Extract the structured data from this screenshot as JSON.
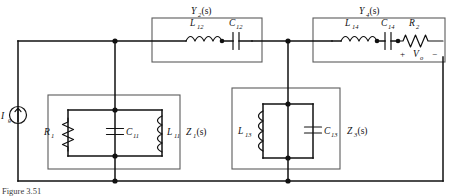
{
  "figure": {
    "caption": "Figure 3.51",
    "type": "ladder-network-circuit-diagram"
  },
  "source": {
    "label": "I",
    "subscript": "g",
    "name": "current-source",
    "direction": "up"
  },
  "output": {
    "plus": "+",
    "label": "V",
    "subscript": "o",
    "minus": "−"
  },
  "blocks": [
    {
      "id": "z1",
      "label": "Z",
      "subscript": "1",
      "arg": "(s)",
      "topology": "shunt",
      "components": [
        {
          "id": "r1",
          "label": "R",
          "subscript": "1",
          "kind": "resistor"
        },
        {
          "id": "c11",
          "label": "C",
          "subscript": "11",
          "kind": "capacitor"
        },
        {
          "id": "l11",
          "label": "L",
          "subscript": "11",
          "kind": "inductor"
        }
      ]
    },
    {
      "id": "y2",
      "label": "Y",
      "subscript": "2",
      "arg": "(s)",
      "topology": "series",
      "components": [
        {
          "id": "l12",
          "label": "L",
          "subscript": "12",
          "kind": "inductor"
        },
        {
          "id": "c12",
          "label": "C",
          "subscript": "12",
          "kind": "capacitor"
        }
      ]
    },
    {
      "id": "z3",
      "label": "Z",
      "subscript": "3",
      "arg": "(s)",
      "topology": "shunt",
      "components": [
        {
          "id": "l13",
          "label": "L",
          "subscript": "13",
          "kind": "inductor"
        },
        {
          "id": "c13",
          "label": "C",
          "subscript": "13",
          "kind": "capacitor"
        }
      ]
    },
    {
      "id": "y4",
      "label": "Y",
      "subscript": "4",
      "arg": "(s)",
      "topology": "series",
      "components": [
        {
          "id": "l14",
          "label": "L",
          "subscript": "14",
          "kind": "inductor"
        },
        {
          "id": "c14",
          "label": "C",
          "subscript": "14",
          "kind": "capacitor"
        },
        {
          "id": "r2",
          "label": "R",
          "subscript": "2",
          "kind": "resistor"
        }
      ]
    }
  ],
  "colors": {
    "wire": "#111111",
    "block_border": "#5b5b5b",
    "background": "#ffffff",
    "text": "#111111"
  }
}
